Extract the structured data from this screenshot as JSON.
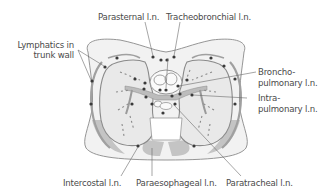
{
  "diagram": {
    "type": "anatomical-cross-section",
    "colors": {
      "background": "#ffffff",
      "outline": "#8a8a8a",
      "fill_light": "#f0f0f0",
      "fill_lung": "#e8e8e8",
      "muscle": "#c4c4c4",
      "node": "#3a3a3a",
      "label_text": "#4a4a4a",
      "leader_line": "#6a6a6a"
    },
    "labels": {
      "parasternal": "Parasternal l.n.",
      "tracheobronchial": "Tracheobronchial l.n.",
      "lymphatics_line1": "Lymphatics in",
      "lymphatics_line2": "trunk wall",
      "broncho_line1": "Broncho-",
      "broncho_line2": "pulmonary l.n.",
      "intra_line1": "Intra-",
      "intra_line2": "pulmonary l.n.",
      "intercostal": "Intercostal l.n.",
      "paraesophageal": "Paraesophageal l.n.",
      "paratracheal": "Paratracheal l.n."
    }
  }
}
